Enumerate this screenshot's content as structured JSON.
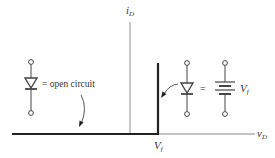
{
  "diagram": {
    "type": "diode-iv-characteristic",
    "axes": {
      "y_label_main": "i",
      "y_label_sub": "D",
      "x_label_main": "v",
      "x_label_sub": "D"
    },
    "threshold_label_main": "V",
    "threshold_label_sub": "f",
    "off_region": {
      "equals_text": "= open circuit"
    },
    "on_region": {
      "equals_text": "=",
      "battery_label_main": "V",
      "battery_label_sub": "f"
    },
    "colors": {
      "axis": "#8a8a8a",
      "curve": "#222222",
      "symbol": "#444444"
    }
  }
}
